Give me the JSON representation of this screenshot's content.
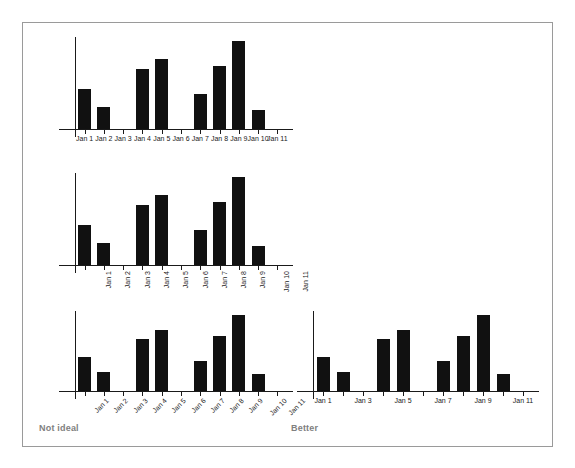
{
  "figure": {
    "background": "#ffffff",
    "frame_color": "#9a9a9a",
    "bar_color": "#111111",
    "axis_color": "#1a1a1a",
    "caption_color": "#808080"
  },
  "captions": {
    "left": "Not ideal",
    "right": "Better"
  },
  "chart_data": [
    {
      "id": "chart-crowded-horizontal",
      "type": "bar",
      "title": "",
      "xlabel": "",
      "ylabel": "",
      "label_orientation": "horizontal",
      "label_every": 1,
      "categories": [
        "Jan 1",
        "Jan 2",
        "Jan 3",
        "Jan 4",
        "Jan 5",
        "Jan 6",
        "Jan 7",
        "Jan 8",
        "Jan 9",
        "Jan 10",
        "Jan 11"
      ],
      "tick_labels": [
        "Jan 1",
        "Jan 2",
        "Jan 3",
        "Jan 4",
        "Jan 5",
        "Jan 6",
        "Jan 7",
        "Jan 8",
        "Jan 9",
        "Jan 10",
        "Jan 11"
      ],
      "values": [
        0.45,
        0.25,
        0,
        0.68,
        0.8,
        0,
        0.4,
        0.72,
        1.0,
        0.22,
        0
      ],
      "ylim": [
        0,
        1.0
      ],
      "grid": false,
      "legend": "none"
    },
    {
      "id": "chart-rotated-vertical",
      "type": "bar",
      "title": "",
      "xlabel": "",
      "ylabel": "",
      "label_orientation": "vertical-90",
      "label_every": 1,
      "categories": [
        "Jan 1",
        "Jan 2",
        "Jan 3",
        "Jan 4",
        "Jan 5",
        "Jan 6",
        "Jan 7",
        "Jan 8",
        "Jan 9",
        "Jan 10",
        "Jan 11"
      ],
      "tick_labels": [
        "Jan 1",
        "Jan 2",
        "Jan 3",
        "Jan 4",
        "Jan 5",
        "Jan 6",
        "Jan 7",
        "Jan 8",
        "Jan 9",
        "Jan 10",
        "Jan 11"
      ],
      "values": [
        0.45,
        0.25,
        0,
        0.68,
        0.8,
        0,
        0.4,
        0.72,
        1.0,
        0.22,
        0
      ],
      "ylim": [
        0,
        1.0
      ],
      "grid": false,
      "legend": "none"
    },
    {
      "id": "chart-rotated-diagonal",
      "type": "bar",
      "title": "",
      "xlabel": "",
      "ylabel": "",
      "label_orientation": "diagonal-45",
      "label_every": 1,
      "categories": [
        "Jan 1",
        "Jan 2",
        "Jan 3",
        "Jan 4",
        "Jan 5",
        "Jan 6",
        "Jan 7",
        "Jan 8",
        "Jan 9",
        "Jan 10",
        "Jan 11"
      ],
      "tick_labels": [
        "Jan 1",
        "Jan 2",
        "Jan 3",
        "Jan 4",
        "Jan 5",
        "Jan 6",
        "Jan 7",
        "Jan 8",
        "Jan 9",
        "Jan 10",
        "Jan 11"
      ],
      "values": [
        0.45,
        0.25,
        0,
        0.68,
        0.8,
        0,
        0.4,
        0.72,
        1.0,
        0.22,
        0
      ],
      "ylim": [
        0,
        1.0
      ],
      "grid": false,
      "legend": "none"
    },
    {
      "id": "chart-thinned-horizontal",
      "type": "bar",
      "title": "",
      "xlabel": "",
      "ylabel": "",
      "label_orientation": "horizontal",
      "label_every": 2,
      "categories": [
        "Jan 1",
        "Jan 2",
        "Jan 3",
        "Jan 4",
        "Jan 5",
        "Jan 6",
        "Jan 7",
        "Jan 8",
        "Jan 9",
        "Jan 10",
        "Jan 11"
      ],
      "tick_labels": [
        "Jan 1",
        "",
        "Jan 3",
        "",
        "Jan 5",
        "",
        "Jan 7",
        "",
        "Jan 9",
        "",
        "Jan 11"
      ],
      "values": [
        0.45,
        0.25,
        0,
        0.68,
        0.8,
        0,
        0.4,
        0.72,
        1.0,
        0.22,
        0
      ],
      "ylim": [
        0,
        1.0
      ],
      "grid": false,
      "legend": "none"
    }
  ]
}
